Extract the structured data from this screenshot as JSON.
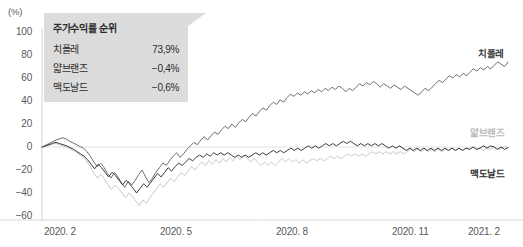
{
  "chart_data": {
    "type": "line",
    "title": "",
    "xlabel": "",
    "ylabel": "(%)",
    "ylim": [
      -60,
      100
    ],
    "yticks": [
      100,
      80,
      60,
      40,
      20,
      0,
      -20,
      -40,
      -60
    ],
    "xticks": [
      "2020. 2",
      "2020. 5",
      "2020. 8",
      "2020. 11",
      "2021. 2"
    ],
    "grid": false,
    "zero_line": true,
    "legend_position": "inside-top-left",
    "series": [
      {
        "name": "치폴레",
        "color": "#6d6e70",
        "final_value": 73.9,
        "values": [
          0,
          1.5,
          3.0,
          4.5,
          6.0,
          7.0,
          8.0,
          7.0,
          5.0,
          3.5,
          2.0,
          0.5,
          -1.0,
          -4.0,
          -8.0,
          -13.0,
          -17.0,
          -14.0,
          -18.0,
          -23.0,
          -27.0,
          -22.0,
          -26.0,
          -31.0,
          -35.0,
          -30.0,
          -33.0,
          -29.0,
          -24.0,
          -20.0,
          -26.0,
          -31.0,
          -27.0,
          -22.0,
          -18.0,
          -14.0,
          -16.0,
          -12.0,
          -8.0,
          -5.0,
          -9.0,
          -6.0,
          -2.0,
          1.0,
          4.0,
          2.0,
          6.0,
          9.0,
          6.0,
          10.0,
          13.0,
          11.0,
          15.0,
          18.0,
          16.0,
          20.0,
          17.0,
          21.0,
          24.0,
          22.0,
          26.0,
          29.0,
          27.0,
          31.0,
          34.0,
          32.0,
          36.0,
          39.0,
          37.0,
          41.0,
          39.0,
          43.0,
          46.0,
          44.0,
          47.0,
          45.0,
          48.0,
          46.0,
          49.0,
          47.0,
          50.0,
          48.0,
          51.0,
          49.0,
          52.0,
          50.0,
          53.0,
          51.0,
          48.0,
          51.0,
          49.0,
          52.0,
          55.0,
          53.0,
          56.0,
          54.0,
          57.0,
          55.0,
          52.0,
          55.0,
          53.0,
          51.0,
          54.0,
          52.0,
          50.0,
          53.0,
          51.0,
          49.0,
          47.0,
          45.0,
          48.0,
          51.0,
          49.0,
          52.0,
          55.0,
          58.0,
          56.0,
          59.0,
          62.0,
          60.0,
          63.0,
          61.0,
          64.0,
          62.0,
          65.0,
          68.0,
          66.0,
          69.0,
          67.0,
          70.0,
          68.0,
          71.0,
          74.0,
          72.0,
          70.0,
          73.9
        ]
      },
      {
        "name": "얇브랜즈",
        "color": "#c8c9cb",
        "final_value": -0.4,
        "values": [
          0,
          0.5,
          1.5,
          2.5,
          3.0,
          2.0,
          1.0,
          0.0,
          -1.5,
          -3.0,
          -5.0,
          -7.0,
          -9.0,
          -13.0,
          -18.0,
          -23.0,
          -27.0,
          -24.0,
          -28.0,
          -33.0,
          -37.0,
          -33.0,
          -36.0,
          -40.0,
          -44.0,
          -40.0,
          -43.0,
          -47.0,
          -51.0,
          -46.0,
          -49.0,
          -44.0,
          -40.0,
          -36.0,
          -32.0,
          -35.0,
          -31.0,
          -27.0,
          -30.0,
          -26.0,
          -22.0,
          -25.0,
          -21.0,
          -17.0,
          -20.0,
          -16.0,
          -13.0,
          -16.0,
          -12.0,
          -15.0,
          -11.0,
          -14.0,
          -10.0,
          -13.0,
          -9.0,
          -12.0,
          -8.0,
          -11.0,
          -7.0,
          -10.0,
          -13.0,
          -10.0,
          -13.0,
          -16.0,
          -13.0,
          -16.0,
          -13.0,
          -16.0,
          -13.0,
          -10.0,
          -13.0,
          -10.0,
          -13.0,
          -11.0,
          -14.0,
          -11.0,
          -14.0,
          -12.0,
          -10.0,
          -12.0,
          -10.0,
          -12.0,
          -10.0,
          -8.0,
          -10.0,
          -8.0,
          -10.0,
          -8.0,
          -6.0,
          -8.0,
          -6.0,
          -8.0,
          -6.0,
          -8.0,
          -6.0,
          -4.0,
          -6.0,
          -4.0,
          -6.0,
          -4.0,
          -6.0,
          -4.0,
          -6.0,
          -4.0,
          -6.0,
          -4.0,
          -2.0,
          -4.0,
          -2.0,
          -4.0,
          -2.0,
          -4.0,
          -2.0,
          -4.0,
          -2.0,
          -4.0,
          -2.0,
          -3.0,
          -1.0,
          -3.0,
          -1.0,
          -3.0,
          -1.0,
          -2.0,
          0.0,
          -2.0,
          -1.0,
          -3.0,
          -1.0,
          -2.0,
          0.0,
          -2.0,
          -1.0,
          0.5,
          -0.4
        ]
      },
      {
        "name": "맥도날드",
        "color": "#3b3b3b",
        "final_value": -0.6,
        "values": [
          0,
          0.8,
          2.0,
          3.2,
          4.0,
          3.0,
          2.0,
          1.0,
          -0.5,
          -2.0,
          -4.0,
          -6.0,
          -8.0,
          -11.0,
          -15.0,
          -19.0,
          -15.0,
          -18.0,
          -22.0,
          -26.0,
          -22.0,
          -25.0,
          -29.0,
          -33.0,
          -29.0,
          -32.0,
          -36.0,
          -40.0,
          -36.0,
          -32.0,
          -35.0,
          -31.0,
          -27.0,
          -23.0,
          -26.0,
          -22.0,
          -18.0,
          -21.0,
          -17.0,
          -14.0,
          -16.0,
          -13.0,
          -10.0,
          -12.0,
          -9.0,
          -7.0,
          -9.0,
          -6.0,
          -8.0,
          -5.0,
          -7.0,
          -5.0,
          -7.0,
          -5.0,
          -7.0,
          -9.0,
          -7.0,
          -9.0,
          -7.0,
          -9.0,
          -7.0,
          -5.0,
          -7.0,
          -5.0,
          -7.0,
          -5.0,
          -3.0,
          -5.0,
          -3.0,
          -5.0,
          -3.0,
          -1.0,
          -3.0,
          -1.0,
          -3.0,
          -1.0,
          1.0,
          -1.0,
          1.0,
          -1.0,
          1.0,
          3.0,
          1.0,
          3.0,
          1.0,
          3.0,
          5.0,
          3.0,
          5.0,
          3.0,
          1.0,
          3.0,
          1.0,
          3.0,
          1.0,
          3.0,
          1.0,
          3.0,
          1.0,
          -1.0,
          1.0,
          -1.0,
          1.0,
          -1.0,
          -3.0,
          -1.0,
          -3.0,
          -1.0,
          -3.0,
          -1.0,
          -3.0,
          -1.0,
          -3.0,
          -1.0,
          -3.0,
          -1.0,
          -3.0,
          -1.0,
          -3.0,
          -1.0,
          -3.0,
          -1.0,
          -2.0,
          0.0,
          -2.0,
          -1.0,
          1.0,
          -1.0,
          1.0,
          0.0,
          -2.0,
          0.0,
          -2.0,
          -0.6
        ]
      }
    ]
  },
  "legend": {
    "title": "주가수익률 순위",
    "rows": [
      {
        "name": "치폴레",
        "value": "73,9%"
      },
      {
        "name": "얇브랜즈",
        "value": "−0,4%"
      },
      {
        "name": "맥도날드",
        "value": "−0,6%"
      }
    ]
  },
  "series_labels": [
    {
      "name": "치폴레",
      "color": "#3b3b3b"
    },
    {
      "name": "얇브랜즈",
      "color": "#b9babc"
    },
    {
      "name": "맥도날드",
      "color": "#2c2c2c"
    }
  ],
  "axis": {
    "unit": "(%)",
    "y_ticks": [
      "100",
      "80",
      "60",
      "40",
      "20",
      "0",
      "−20",
      "−40",
      "−60"
    ],
    "x_ticks": [
      "2020. 2",
      "2020. 5",
      "2020. 8",
      "2020. 11",
      "2021. 2"
    ]
  }
}
